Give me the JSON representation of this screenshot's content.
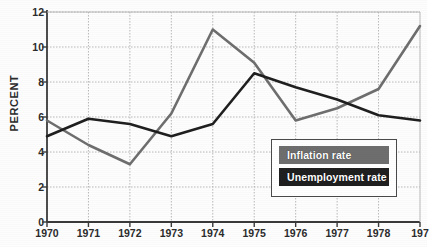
{
  "chart_data": {
    "type": "line",
    "title": "",
    "xlabel": "",
    "ylabel": "PERCENT",
    "x": [
      1970,
      1971,
      1972,
      1973,
      1974,
      1975,
      1976,
      1977,
      1978,
      1979
    ],
    "xtick_labels": [
      "1970",
      "1971",
      "1972",
      "1973",
      "1974",
      "1975",
      "1976",
      "1977",
      "1978",
      "197"
    ],
    "ytick_labels": [
      "0",
      "2",
      "4",
      "6",
      "8",
      "10",
      "12"
    ],
    "yticks": [
      0,
      2,
      4,
      6,
      8,
      10,
      12
    ],
    "ylim": [
      0,
      12
    ],
    "xlim": [
      1970,
      1979
    ],
    "grid": true,
    "grid_style": "dotted",
    "legend_position": "lower-right",
    "series": [
      {
        "name": "Inflation rate",
        "color": "#6e6e6e",
        "values": [
          5.8,
          4.4,
          3.3,
          6.2,
          11.0,
          9.1,
          5.8,
          6.5,
          7.6,
          11.2
        ]
      },
      {
        "name": "Unemployment rate",
        "color": "#1f1f1f",
        "values": [
          4.9,
          5.9,
          5.6,
          4.9,
          5.6,
          8.5,
          7.7,
          7.0,
          6.1,
          5.8
        ]
      }
    ]
  },
  "legend": {
    "entries": [
      {
        "label": "Inflation rate",
        "swatch_color": "#6e6e6e"
      },
      {
        "label": "Unemployment rate",
        "swatch_color": "#1f1f1f"
      }
    ]
  },
  "axis_colors": {
    "axis_line": "#3a3a3a",
    "grid_line": "#b9b9b9",
    "tick_text": "#2b2b2b"
  }
}
